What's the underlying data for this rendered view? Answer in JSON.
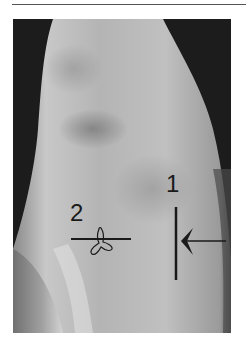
{
  "figure": {
    "labels": [
      {
        "id": "1",
        "text": "1"
      },
      {
        "id": "2",
        "text": "2"
      }
    ],
    "annotations": {
      "marker_1": "vertical line with left-pointing arrow",
      "marker_2": "horizontal line with tri-lobed marker"
    }
  }
}
